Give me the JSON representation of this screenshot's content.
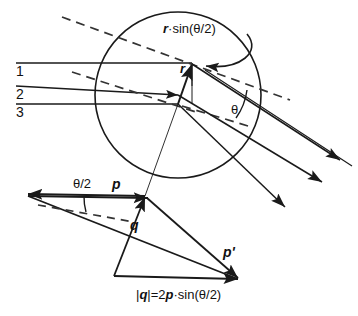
{
  "figure": {
    "stroke_color": "#1a1a1a",
    "background_color": "#ffffff",
    "dashed_color": "#333333"
  },
  "circle": {
    "label": "scattering-center-circle",
    "cx": 178,
    "cy": 95,
    "r": 83
  },
  "incoming_rays": [
    {
      "label": "1",
      "y": 63
    },
    {
      "label": "2",
      "y": 86
    },
    {
      "label": "3",
      "y": 104
    }
  ],
  "annotations": {
    "impact_parameter": "r·sin(θ/2)",
    "radius_vector": "r",
    "scattering_angle": "θ",
    "half_angle": "θ/2",
    "momentum_in": "p",
    "momentum_out": "p'",
    "momentum_transfer": "q",
    "formula": "|q|=2p·sin(θ/2)"
  },
  "formula_parts": {
    "abs_open": "|",
    "q": "q",
    "abs_close": "|",
    "equals": "=2",
    "p": "p",
    "tail": "·sin(θ/2)"
  },
  "vector_triangle": {
    "p_start": {
      "x": 28,
      "y": 194
    },
    "p_end": {
      "x": 145,
      "y": 196
    },
    "q_start": {
      "x": 114,
      "y": 276
    },
    "q_end": {
      "x": 145,
      "y": 196
    },
    "p_prime_start": {
      "x": 145,
      "y": 196
    },
    "p_prime_end": {
      "x": 238,
      "y": 278
    },
    "base_start": {
      "x": 114,
      "y": 276
    },
    "base_end": {
      "x": 238,
      "y": 279
    }
  }
}
